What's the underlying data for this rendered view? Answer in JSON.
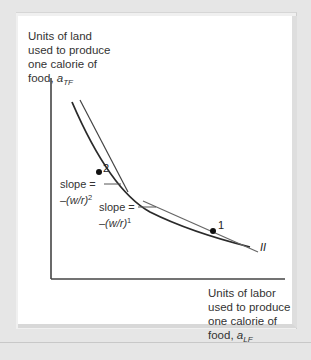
{
  "diagram": {
    "y_axis_label": {
      "lines": [
        "Units of land",
        "used to produce",
        "one calorie of"
      ],
      "last_prefix": "food, ",
      "var": "a",
      "sub": "TF"
    },
    "x_axis_label": {
      "lines": [
        "Units of labor",
        "used to produce",
        "one calorie of"
      ],
      "last_prefix": "food, ",
      "var": "a",
      "sub": "LF"
    },
    "curve_label": "II",
    "points": [
      {
        "id": "2",
        "label": "2",
        "x": 99,
        "y": 172
      },
      {
        "id": "1",
        "label": "1",
        "x": 213,
        "y": 231
      }
    ],
    "slope_labels": [
      {
        "prefix": "slope =",
        "expr": "–(w/r)",
        "sup": "2"
      },
      {
        "prefix": "slope =",
        "expr": "–(w/r)",
        "sup": "1"
      }
    ],
    "colors": {
      "curve": "#2a2a2a",
      "tangent": "#555555",
      "axis": "#444444",
      "background": "#e6e6e6",
      "panel": "#ffffff"
    }
  }
}
